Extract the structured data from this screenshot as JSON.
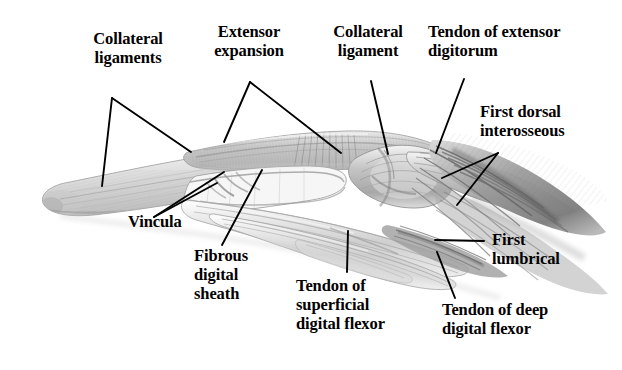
{
  "figure": {
    "style": "grayscale pencil illustration",
    "width": 622,
    "height": 370,
    "background_color": "#ffffff",
    "ink_color": "#000000",
    "drawing_tones": {
      "lightest": "#f2f2f2",
      "light": "#d8d8d8",
      "mid": "#b0b0b0",
      "dark": "#8a8a8a",
      "darkest": "#5a5a5a"
    }
  },
  "labels": [
    {
      "id": "collateral-ligaments",
      "text": "Collateral\nligaments",
      "align": "center",
      "x": 72,
      "y": 29,
      "width": 112
    },
    {
      "id": "extensor-expansion",
      "text": "Extensor\nexpansion",
      "align": "center",
      "x": 191,
      "y": 22,
      "width": 116
    },
    {
      "id": "collateral-ligament",
      "text": "Collateral\nligament",
      "align": "center",
      "x": 313,
      "y": 22,
      "width": 110
    },
    {
      "id": "tendon-of-extensor-digitorum",
      "text": "Tendon of extensor\ndigitorum",
      "align": "left",
      "x": 428,
      "y": 22,
      "width": 180
    },
    {
      "id": "first-dorsal-interosseous",
      "text": "First dorsal\ninterosseous",
      "align": "left",
      "x": 480,
      "y": 102,
      "width": 140
    },
    {
      "id": "vincula",
      "text": "Vincula",
      "align": "left",
      "x": 128,
      "y": 212,
      "width": 90
    },
    {
      "id": "fibrous-digital-sheath",
      "text": "Fibrous\ndigital\nsheath",
      "align": "left",
      "x": 194,
      "y": 246,
      "width": 90
    },
    {
      "id": "tendon-of-superficial-digital-flexor",
      "text": "Tendon of\nsuperficial\ndigital flexor",
      "align": "left",
      "x": 296,
      "y": 276,
      "width": 125
    },
    {
      "id": "first-lumbrical",
      "text": "First\nlumbrical",
      "align": "left",
      "x": 492,
      "y": 230,
      "width": 110
    },
    {
      "id": "tendon-of-deep-digital-flexor",
      "text": "Tendon of deep\ndigital flexor",
      "align": "left",
      "x": 442,
      "y": 300,
      "width": 150
    }
  ],
  "leader_lines": [
    {
      "id": "leader-collateral-ligaments-a",
      "points": "112,98 102,186"
    },
    {
      "id": "leader-collateral-ligaments-b",
      "points": "112,98 191,152"
    },
    {
      "id": "leader-extensor-expansion-a",
      "points": "250,82 224,142"
    },
    {
      "id": "leader-extensor-expansion-b",
      "points": "250,82 341,153"
    },
    {
      "id": "leader-collateral-ligament",
      "points": "371,81 388,154"
    },
    {
      "id": "leader-tendon-extensor-digitorum",
      "points": "464,79 436,153"
    },
    {
      "id": "leader-first-dorsal-interosseous-a",
      "points": "498,153 442,178"
    },
    {
      "id": "leader-first-dorsal-interosseous-b",
      "points": "498,153 457,205"
    },
    {
      "id": "leader-vincula-a",
      "points": "154,217 224,172"
    },
    {
      "id": "leader-vincula-b",
      "points": "154,217 217,183"
    },
    {
      "id": "leader-fibrous-digital-sheath",
      "points": "222,245 262,170"
    },
    {
      "id": "leader-tendon-superficial-digital-flexor",
      "points": "347,272 348,231"
    },
    {
      "id": "leader-first-lumbrical",
      "points": "484,241 435,240"
    },
    {
      "id": "leader-tendon-deep-digital-flexor",
      "points": "455,298 437,252"
    }
  ]
}
